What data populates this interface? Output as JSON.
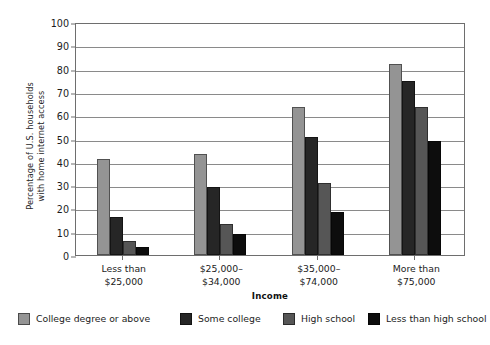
{
  "chart_data": {
    "type": "bar",
    "title": "",
    "xlabel": "Income",
    "ylabel": "Percentage of U.S. households\nwith home internet access",
    "ylim": [
      0,
      100
    ],
    "ytick_step": 10,
    "yticks": [
      "0",
      "10",
      "20",
      "30",
      "40",
      "50",
      "60",
      "70",
      "80",
      "90",
      "100"
    ],
    "grid": true,
    "legend_position": "bottom",
    "categories": [
      "Less than\n$25,000",
      "$25,000–\n$34,000",
      "$35,000–\n$74,000",
      "More than\n$75,000"
    ],
    "series": [
      {
        "name": "College degree or above",
        "color": "#949494",
        "values": [
          41,
          43.5,
          63.5,
          82
        ]
      },
      {
        "name": "Some college",
        "color": "#262626",
        "values": [
          16.5,
          29,
          50.5,
          74.5
        ]
      },
      {
        "name": "High school",
        "color": "#565656",
        "values": [
          6,
          13.5,
          31,
          63.5
        ]
      },
      {
        "name": "Less than high school",
        "color": "#0d0d0d",
        "values": [
          3.5,
          9,
          18.5,
          49
        ]
      }
    ]
  },
  "colors": {
    "axis": "#6e6e6e",
    "gridline": "#8a8a8a",
    "text": "#1c1c1c",
    "background": "#ffffff"
  }
}
